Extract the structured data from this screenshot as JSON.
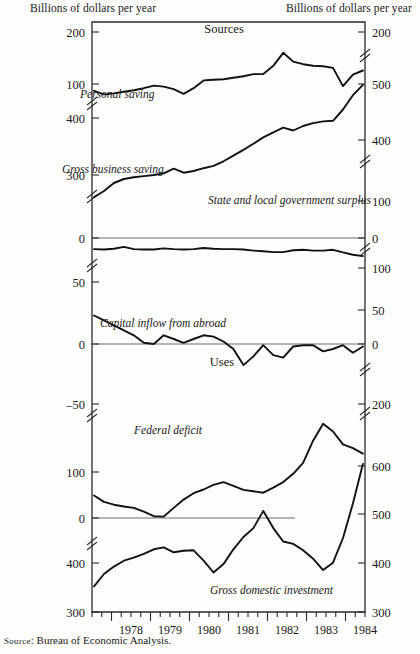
{
  "header": {
    "left_axis_title": "Billions of dollars per year",
    "right_axis_title": "Billions of dollars per year"
  },
  "source_note": {
    "label": "Source",
    "text": ": Bureau of Economic Analysis."
  },
  "panels": [
    {
      "name": "sources",
      "label": "Sources"
    },
    {
      "name": "uses",
      "label": "Uses"
    }
  ],
  "chart_data": {
    "type": "line",
    "subtitle": "",
    "xlabel": "",
    "ylabel": "Billions of dollars per year",
    "grid": false,
    "legend": "inline-annotations",
    "x": [
      "1977.5",
      "1977.75",
      "1978",
      "1978.25",
      "1978.5",
      "1978.75",
      "1979",
      "1979.25",
      "1979.5",
      "1979.75",
      "1980",
      "1980.25",
      "1980.5",
      "1980.75",
      "1981",
      "1981.25",
      "1981.5",
      "1981.75",
      "1982",
      "1982.25",
      "1982.5",
      "1982.75",
      "1983",
      "1983.25",
      "1983.5",
      "1983.75",
      "1984",
      "1984.25"
    ],
    "x_tick_labels": [
      "1978",
      "1979",
      "1980",
      "1981",
      "1982",
      "1983",
      "1984"
    ],
    "x_minor_ticks_per_year": 4,
    "axes": [
      {
        "name": "sources-left",
        "side": "left",
        "segments": [
          {
            "labels": [
              "200",
              "100"
            ],
            "values": [
              200,
              100
            ],
            "broken_below": true
          },
          {
            "labels": [
              "400",
              "300"
            ],
            "values": [
              400,
              300
            ],
            "broken_above": true,
            "broken_below": true
          },
          {
            "labels": [
              "0"
            ],
            "values": [
              0
            ]
          }
        ]
      },
      {
        "name": "sources-right",
        "side": "right",
        "segments": [
          {
            "labels": [
              "200"
            ],
            "values": [
              200
            ],
            "broken_below": true
          },
          {
            "labels": [
              "500",
              "400"
            ],
            "values": [
              500,
              400
            ],
            "broken_below": true
          },
          {
            "labels": [
              "100",
              "0"
            ],
            "values": [
              100,
              0
            ]
          }
        ]
      },
      {
        "name": "middle-left",
        "side": "left",
        "segments": [
          {
            "labels": [
              "0"
            ],
            "values": [
              0
            ],
            "broken_below": true
          },
          {
            "labels": [
              "50",
              "0",
              "‒50"
            ],
            "values": [
              50,
              0,
              -50
            ]
          }
        ]
      },
      {
        "name": "middle-right",
        "side": "right",
        "segments": [
          {
            "labels": [
              "0"
            ],
            "values": [
              0
            ],
            "broken_below": true
          },
          {
            "labels": [
              "100",
              "50",
              "0"
            ],
            "values": [
              100,
              50,
              0
            ]
          }
        ]
      },
      {
        "name": "uses-left",
        "side": "left",
        "segments": [
          {
            "labels": [
              "100",
              "0"
            ],
            "values": [
              100,
              0
            ],
            "broken_below": true
          },
          {
            "labels": [
              "400",
              "300"
            ],
            "values": [
              400,
              300
            ]
          }
        ]
      },
      {
        "name": "uses-right",
        "side": "right",
        "segments": [
          {
            "labels": [
              "200"
            ],
            "values": [
              200
            ],
            "broken_above": true,
            "broken_below": true
          },
          {
            "labels": [
              "600",
              "500",
              "400",
              "300"
            ],
            "values": [
              600,
              500,
              400,
              300
            ]
          }
        ]
      }
    ],
    "series": [
      {
        "name": "Personal saving",
        "label": "Personal saving",
        "panel": "sources",
        "axis": "sources-left",
        "units": "billions of dollars per year",
        "values": [
          87,
          80,
          82,
          85,
          88,
          92,
          97,
          95,
          90,
          81,
          92,
          107,
          108,
          109,
          112,
          115,
          119,
          119,
          135,
          160,
          143,
          138,
          135,
          134,
          131,
          96,
          118,
          126
        ]
      },
      {
        "name": "Gross business saving",
        "label": "Gross business saving",
        "panel": "sources",
        "axis": "sources-left",
        "units": "billions of dollars per year",
        "values": [
          261,
          272,
          286,
          293,
          296,
          298,
          300,
          303,
          311,
          304,
          307,
          312,
          316,
          324,
          334,
          344,
          355,
          366,
          375,
          383,
          378,
          386,
          391,
          394,
          395,
          415,
          440,
          458
        ]
      },
      {
        "name": "State and local government surplus",
        "label": "State and local government surplus",
        "panel": "sources",
        "axis": "sources-right",
        "units": "billions of dollars per year",
        "values": [
          30,
          31,
          29,
          24,
          30,
          31,
          31,
          28,
          30,
          31,
          30,
          27,
          29,
          30,
          30,
          31,
          34,
          36,
          38,
          38,
          33,
          32,
          34,
          34,
          32,
          39,
          45,
          49
        ]
      },
      {
        "name": "Capital inflow from abroad",
        "label": "Capital inflow from abroad",
        "panel": "middle",
        "axis": "middle-left",
        "units": "billions of dollars per year",
        "values": [
          23,
          19,
          15,
          11,
          7,
          1,
          0,
          7,
          4,
          1,
          4,
          7,
          6,
          2,
          -4,
          -17,
          -10,
          -1,
          -9,
          -11,
          -2,
          -1,
          -1,
          -6,
          -4,
          -1,
          -7,
          -2
        ]
      },
      {
        "name": "Federal deficit",
        "label": "Federal deficit",
        "panel": "uses",
        "axis": "uses-left",
        "units": "billions of dollars per year",
        "values": [
          49,
          35,
          29,
          25,
          22,
          14,
          4,
          3,
          22,
          40,
          54,
          62,
          72,
          78,
          70,
          61,
          58,
          55,
          66,
          78,
          96,
          120,
          168,
          205,
          188,
          160,
          152,
          140
        ]
      },
      {
        "name": "Gross domestic investment",
        "label": "Gross domestic investment",
        "panel": "uses",
        "axis": "uses-right",
        "units": "billions of dollars per year",
        "values": [
          352,
          377,
          392,
          404,
          410,
          418,
          427,
          431,
          421,
          424,
          425,
          404,
          380,
          397,
          427,
          452,
          470,
          505,
          470,
          443,
          438,
          425,
          408,
          385,
          400,
          450,
          520,
          600
        ]
      }
    ],
    "annotations": [
      {
        "text": "Sources",
        "panel": "sources"
      },
      {
        "text": "Uses",
        "panel": "uses"
      },
      {
        "text": "Personal saving",
        "panel": "sources"
      },
      {
        "text": "Gross business saving",
        "panel": "sources"
      },
      {
        "text": "State and local government surplus",
        "panel": "sources"
      },
      {
        "text": "Capital inflow from abroad",
        "panel": "middle"
      },
      {
        "text": "Federal deficit",
        "panel": "uses"
      },
      {
        "text": "Gross domestic investment",
        "panel": "uses"
      }
    ]
  }
}
